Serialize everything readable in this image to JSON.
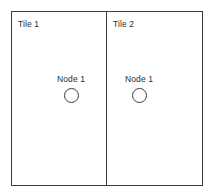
{
  "diagram": {
    "colors": {
      "stroke": "#3c3c3c",
      "text": "#2b2b2b",
      "background": "#ffffff"
    },
    "tiles": [
      {
        "label": "Tile 1",
        "node": {
          "label": "Node 1",
          "shape": "circle"
        }
      },
      {
        "label": "Tile 2",
        "node": {
          "label": "Node 1",
          "shape": "circle"
        }
      }
    ]
  }
}
